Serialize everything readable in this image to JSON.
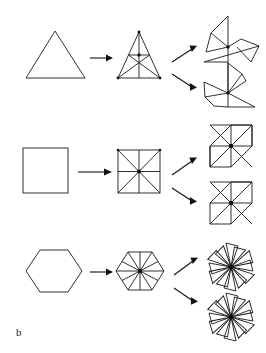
{
  "figure": {
    "panel_label": "b",
    "panel_label_pos": {
      "x": 16,
      "y": 326
    },
    "background_color": "#ffffff",
    "stroke_color": "#1a1a1a",
    "width": 266,
    "height": 353,
    "caption_text": "b"
  },
  "rows": [
    {
      "id": "triangle-row",
      "name": "triangle",
      "source_shape": "triangle",
      "piece_count": 6,
      "result_count": 2
    },
    {
      "id": "square-row",
      "name": "square",
      "source_shape": "square",
      "piece_count": 8,
      "result_count": 2
    },
    {
      "id": "hexagon-row",
      "name": "hexagon",
      "source_shape": "hexagon",
      "piece_count": 12,
      "result_count": 2
    }
  ],
  "geometry": {
    "triangle_source": {
      "points": "26,78 85,78 55,31",
      "center": {
        "x": 55,
        "y": 62
      }
    },
    "triangle_dissected": {
      "points": "118,78 160,78 139,32",
      "medians": [
        "139,32 139,78",
        "118,78 149.5,55",
        "160,78 128.5,55",
        "128.5,55 149.5,55",
        "128.5,55 139,78",
        "149.5,55 139,78"
      ],
      "hub": {
        "x": 139,
        "y": 55
      },
      "top_dot": {
        "x": 139,
        "y": 32
      },
      "left_dot": {
        "x": 118,
        "y": 78
      },
      "right_dot": {
        "x": 160,
        "y": 78
      }
    },
    "triangle_pinwheel_top": {
      "hub": {
        "x": 228,
        "y": 46
      },
      "blades": [
        "228,46 228,17 211,34",
        "228,46 211,34 206,53",
        "228,46 206,53 204,57",
        "228,46 249,39 259,46",
        "228,46 259,46 252,60",
        "228,46 252,60 240,40"
      ]
    },
    "triangle_pinwheel_bottom": {
      "hub": {
        "x": 228,
        "y": 93
      },
      "blades": [
        "228,93 228,64 241,75",
        "228,93 241,75 244,81",
        "228,93 207,82 204,96",
        "228,93 204,96 213,104",
        "228,93 213,104 228,105",
        "228,93 228,105 252,105"
      ]
    },
    "square_source": {
      "points": "23,148 68,148 68,193 23,193",
      "center": {
        "x": 45.5,
        "y": 170.5
      }
    },
    "square_dissected": {
      "points": "118,150 160,150 160,193 118,193",
      "inner_lines": [
        "118,150 160,193",
        "160,150 118,193",
        "139,150 139,193",
        "118,171.5 160,171.5"
      ],
      "hub": {
        "x": 139,
        "y": 171.5
      },
      "corner_dots": [
        {
          "x": 118,
          "y": 150
        },
        {
          "x": 160,
          "y": 150
        },
        {
          "x": 118,
          "y": 193
        },
        {
          "x": 160,
          "y": 193
        }
      ]
    },
    "square_pinwheel_top": {
      "hub": {
        "x": 231,
        "y": 146
      },
      "blades": [
        "231,146 210,125 231,125 252,125",
        "231,146 252,125 252,146 252,167",
        "231,146 252,167 231,167 210,167",
        "231,146 210,167 210,146 210,125"
      ],
      "outline": "210,125 252,125 252,146 231,167 210,167 210,146 231,125 252,125",
      "diagonals": [
        "210,125 252,167",
        "252,125 210,167"
      ]
    },
    "square_pinwheel_bottom": {
      "hub": {
        "x": 231,
        "y": 203
      },
      "diagonals": [
        "210,182 252,224",
        "252,182 210,224"
      ]
    },
    "hexagon_source": {
      "points": "26,271 40,250 68,250 82,271 68,292 40,292",
      "center": {
        "x": 54,
        "y": 271
      }
    },
    "hexagon_dissected": {
      "points": "116,271 128,252 152,252 164,271 152,290 128,290",
      "spokes": [
        "140,271 116,271",
        "140,271 128,252",
        "140,271 152,252",
        "140,271 164,271",
        "140,271 152,290",
        "140,271 128,290",
        "140,271 140,252",
        "140,271 140,290",
        "140,271 122,261.5",
        "140,271 158,261.5",
        "140,271 122,280.5",
        "140,271 158,280.5"
      ],
      "hub": {
        "x": 140,
        "y": 271
      }
    },
    "hexagon_rosette_top": {
      "hub": {
        "x": 231,
        "y": 267
      },
      "blade_count": 6,
      "blade_length": 24,
      "blade_width": 11
    },
    "hexagon_rosette_bottom": {
      "hub": {
        "x": 231,
        "y": 317
      },
      "blade_count": 6,
      "blade_length": 24,
      "blade_width": 11
    }
  },
  "arrows": {
    "straight": [
      {
        "id": "arrow-triangle-main",
        "x1": 90,
        "y1": 58,
        "x2": 112,
        "y2": 58
      },
      {
        "id": "arrow-square-main",
        "x1": 78,
        "y1": 172,
        "x2": 112,
        "y2": 172
      },
      {
        "id": "arrow-hexagon-main",
        "x1": 90,
        "y1": 272,
        "x2": 112,
        "y2": 272
      }
    ],
    "diagonal": [
      {
        "id": "arrow-triangle-up",
        "x1": 172,
        "y1": 60,
        "x2": 196,
        "y2": 46
      },
      {
        "id": "arrow-triangle-down",
        "x1": 172,
        "y1": 74,
        "x2": 196,
        "y2": 89
      },
      {
        "id": "arrow-square-up",
        "x1": 172,
        "y1": 172,
        "x2": 196,
        "y2": 156
      },
      {
        "id": "arrow-square-down",
        "x1": 172,
        "y1": 186,
        "x2": 196,
        "y2": 202
      },
      {
        "id": "arrow-hexagon-up",
        "x1": 174,
        "y1": 272,
        "x2": 197,
        "y2": 258
      },
      {
        "id": "arrow-hexagon-down",
        "x1": 174,
        "y1": 286,
        "x2": 197,
        "y2": 302
      }
    ]
  }
}
